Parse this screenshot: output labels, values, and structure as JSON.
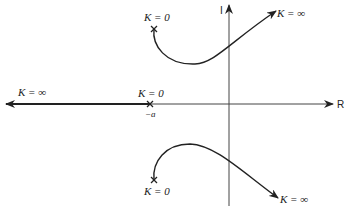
{
  "diagram": {
    "type": "root-locus",
    "axes": {
      "real_label": "R",
      "imag_label": "I"
    },
    "real_axis_branch": {
      "start_label": "K = 0",
      "end_label": "K = ∞",
      "pole_label": "−a"
    },
    "upper_branch": {
      "start_label": "K = 0",
      "end_label": "K = ∞"
    },
    "lower_branch": {
      "start_label": "K = 0",
      "end_label": "K = ∞"
    }
  }
}
